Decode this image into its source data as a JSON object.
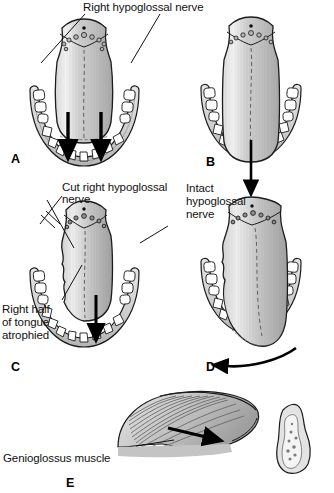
{
  "figure": {
    "background": "#ffffff",
    "ink": "#111111",
    "tongue_fill_light": "#f2f2f2",
    "tongue_fill_mid": "#c9c9c9",
    "tongue_fill_dark": "#9a9a9a",
    "mandible_fill": "#d6d6d6",
    "tooth_fill": "#ffffff",
    "arrow_color": "#000000"
  },
  "labels": {
    "right_hypoglossal_nerve": "Right hypoglossal nerve",
    "cut_right_hypoglossal_nerve_line1": "Cut right hypoglossal",
    "cut_right_hypoglossal_nerve_line2": "nerve",
    "intact_hypoglossal_nerve_line1": "Intact",
    "intact_hypoglossal_nerve_line2": "hypoglossal",
    "intact_hypoglossal_nerve_line3": "nerve",
    "right_half_atrophied_line1": "Right half",
    "right_half_atrophied_line2": "of tongue",
    "right_half_atrophied_line3": "atrophied",
    "genioglossus_muscle": "Genioglossus muscle"
  },
  "panels": [
    {
      "id": "A",
      "letter": "A",
      "caption": "Normal tongue, both hypoglossal nerves intact, symmetric protrusion"
    },
    {
      "id": "B",
      "letter": "B",
      "caption": "Normal tongue protrudes straight in the midline"
    },
    {
      "id": "C",
      "letter": "C",
      "caption": "Right hypoglossal nerve cut, right half of tongue atrophied"
    },
    {
      "id": "D",
      "letter": "D",
      "caption": "Tongue deviates toward the weak (right) side on protrusion"
    },
    {
      "id": "E",
      "letter": "E",
      "caption": "Sagittal view: genioglossus muscle pulls tongue forward"
    }
  ]
}
